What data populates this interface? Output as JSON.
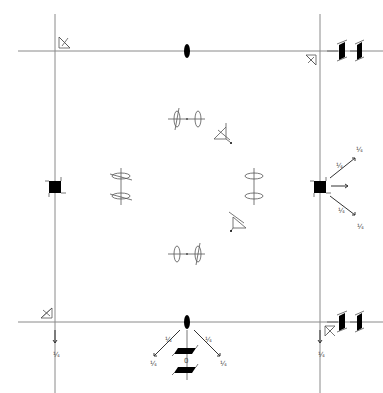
{
  "diagram": {
    "type": "symmetry-element-diagram",
    "colors": {
      "line": "#8a8a8a",
      "symbol": "#000000",
      "background": "#ffffff"
    },
    "cell": {
      "left": 55,
      "top": 51,
      "right": 320,
      "bottom": 322
    },
    "labels": {
      "bottom_axis_label": "0",
      "arrow_marker": "¼"
    },
    "elements": [
      {
        "name": "corner-tl-mirror-triangle",
        "kind": "3-fold-like triangle"
      },
      {
        "name": "corner-tr-mirror-triangle",
        "kind": "triangle"
      },
      {
        "name": "corner-bl-mirror-triangle",
        "kind": "triangle"
      },
      {
        "name": "corner-br-mirror-triangle",
        "kind": "triangle"
      },
      {
        "name": "top-edge-2fold-axis",
        "kind": "2-fold ellipse"
      },
      {
        "name": "bottom-edge-2fold-axis",
        "kind": "2-fold ellipse"
      },
      {
        "name": "left-edge-4fold-screw",
        "kind": "filled square"
      },
      {
        "name": "right-edge-4fold-screw",
        "kind": "filled square"
      },
      {
        "name": "top-right-tetrad-pair",
        "kind": "parallelograms"
      },
      {
        "name": "bottom-right-tetrad-pair",
        "kind": "parallelograms"
      },
      {
        "name": "bottom-center-tetrad-stack",
        "kind": "parallelograms"
      }
    ]
  }
}
